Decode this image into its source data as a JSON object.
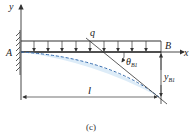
{
  "figure": {
    "caption": "(c)",
    "labels": {
      "y_axis": "y",
      "x_axis": "x",
      "point_a": "A",
      "point_b": "B",
      "load": "q",
      "theta": "θ",
      "theta_sub": "B1",
      "deflection": "y",
      "deflection_sub": "B1",
      "length": "l"
    },
    "colors": {
      "line": "#333333",
      "deflection_curve": "#3a6fb0",
      "deflection_fill": "#cfe4f5"
    },
    "load_arrow_count": 10
  }
}
